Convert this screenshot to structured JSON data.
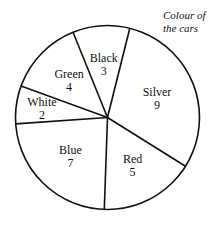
{
  "chart_data": {
    "type": "pie",
    "title": "Colour of the cars",
    "start_angle_deg": 14,
    "direction": "clockwise",
    "slices": [
      {
        "label": "Silver",
        "value": 9
      },
      {
        "label": "Red",
        "value": 5
      },
      {
        "label": "Blue",
        "value": 7
      },
      {
        "label": "White",
        "value": 2
      },
      {
        "label": "Green",
        "value": 4
      },
      {
        "label": "Black",
        "value": 3
      }
    ],
    "total": 30,
    "legend": "none",
    "fill": "#ffffff",
    "stroke": "#111111"
  },
  "title_lines": [
    "Colour of",
    "the cars"
  ]
}
